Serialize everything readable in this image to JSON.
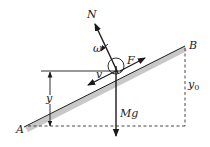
{
  "diagram": {
    "type": "physics-free-body-diagram",
    "points": {
      "A": {
        "label": "A"
      },
      "B": {
        "label": "B"
      }
    },
    "forces": [
      {
        "id": "normal",
        "label": "N",
        "direction": "perpendicular-to-incline-up-left"
      },
      {
        "id": "gravity",
        "label": "Mg",
        "direction": "down"
      },
      {
        "id": "friction",
        "label": "F",
        "direction": "along-incline-toward-B"
      }
    ],
    "kinematics": {
      "velocity_label": "v",
      "angular_velocity_label": "ω"
    },
    "dimensions": {
      "height_label": "y",
      "total_height_label": "y",
      "total_height_subscript": "0"
    },
    "colors": {
      "line": "#1a1a1a",
      "incline_shade": "#c8c8c8",
      "dashed": "#333333"
    }
  }
}
